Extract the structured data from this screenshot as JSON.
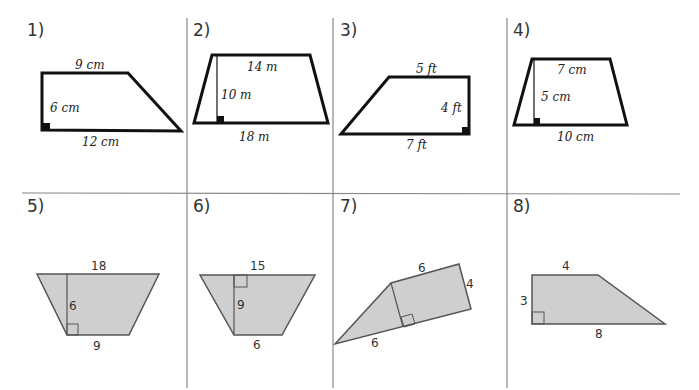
{
  "worksheet": {
    "problems": [
      {
        "number": "1)",
        "labels": {
          "top": "9 cm",
          "height": "6 cm",
          "bottom": "12 cm"
        }
      },
      {
        "number": "2)",
        "labels": {
          "top": "14 m",
          "height": "10 m",
          "bottom": "18 m"
        }
      },
      {
        "number": "3)",
        "labels": {
          "top": "5 ft",
          "height": "4 ft",
          "bottom": "7 ft"
        }
      },
      {
        "number": "4)",
        "labels": {
          "top": "7 cm",
          "height": "5 cm",
          "bottom": "10 cm"
        }
      },
      {
        "number": "5)",
        "labels": {
          "top": "18",
          "height": "6",
          "bottom": "9"
        }
      },
      {
        "number": "6)",
        "labels": {
          "top": "15",
          "height": "9",
          "bottom": "6"
        }
      },
      {
        "number": "7)",
        "labels": {
          "top": "6",
          "height": "4",
          "bottom": "6"
        }
      },
      {
        "number": "8)",
        "labels": {
          "top": "4",
          "height": "3",
          "bottom": "8"
        }
      }
    ]
  },
  "colors": {
    "outline": "#111111",
    "shaded_fill": "#cfcfcf",
    "shaded_stroke": "#555555",
    "grid_line": "#888888"
  }
}
